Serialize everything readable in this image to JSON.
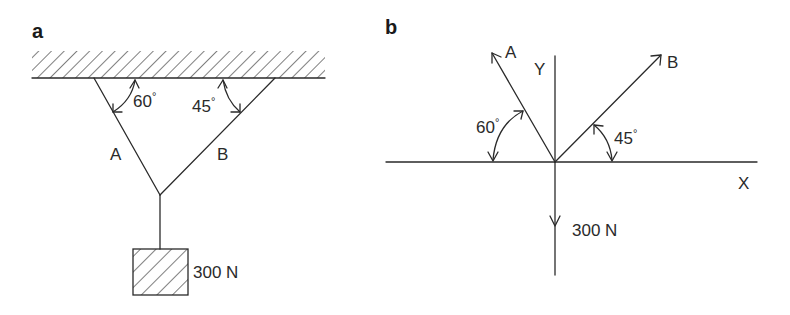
{
  "panels": [
    {
      "id": "a",
      "label": "a",
      "title": "Physical setup: weight suspended by two ropes from ceiling",
      "ceiling": {
        "hatched": true
      },
      "ropes": [
        {
          "name": "A",
          "label": "A",
          "angle_with_ceiling": "60°"
        },
        {
          "name": "B",
          "label": "B",
          "angle_with_ceiling": "45°"
        }
      ],
      "angle_labels": {
        "a": "60",
        "b": "45",
        "degree": "°"
      },
      "weight": {
        "label": "300 N",
        "hatched": true
      }
    },
    {
      "id": "b",
      "label": "b",
      "title": "Free-body diagram at junction",
      "axes": {
        "x_label": "X",
        "y_label": "Y"
      },
      "vectors": [
        {
          "name": "A",
          "label": "A",
          "angle_from_negative_x": "60°",
          "direction": "up-left"
        },
        {
          "name": "B",
          "label": "B",
          "angle_from_positive_x": "45°",
          "direction": "up-right"
        },
        {
          "name": "W",
          "label": "300 N",
          "direction": "down"
        }
      ],
      "angle_labels": {
        "a": "60",
        "b": "45",
        "degree": "°"
      }
    }
  ]
}
